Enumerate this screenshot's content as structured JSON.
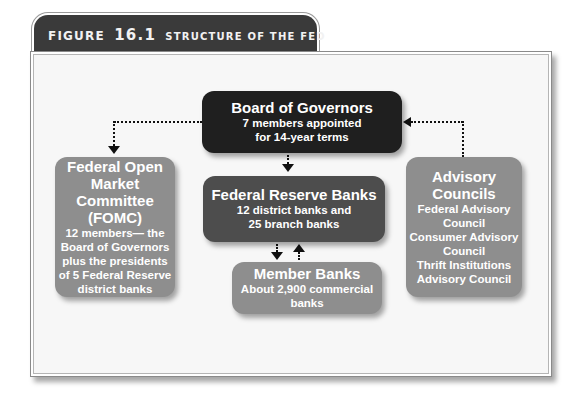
{
  "figure": {
    "label": "FIGURE",
    "number": "16.1",
    "caption": "STRUCTURE OF THE FED"
  },
  "nodes": {
    "board": {
      "title": "Board of Governors",
      "lines": [
        "7 members appointed",
        "for 14-year terms"
      ],
      "color": "#1f1f1f"
    },
    "federal_reserve_banks": {
      "title": "Federal Reserve Banks",
      "lines": [
        "12 district banks and",
        "25 branch banks"
      ],
      "color": "#4d4d4d"
    },
    "member_banks": {
      "title": "Member Banks",
      "lines": [
        "About 2,900 commercial banks"
      ],
      "color": "#8e8e8e"
    },
    "fomc": {
      "title_lines": [
        "Federal Open",
        "Market",
        "Committee (FOMC)"
      ],
      "lines": [
        "12 members— the",
        "Board of Governors",
        "plus the presidents",
        "of 5 Federal Reserve",
        "district banks"
      ],
      "color": "#8e8e8e"
    },
    "advisory": {
      "title_lines": [
        "Advisory",
        "Councils"
      ],
      "lines": [
        "Federal Advisory",
        "Council",
        "Consumer Advisory",
        "Council",
        "Thrift Institutions",
        "Advisory Council"
      ],
      "color": "#8e8e8e"
    }
  },
  "edges": [
    {
      "from": "board",
      "to": "fomc",
      "style": "dotted",
      "arrow": "to"
    },
    {
      "from": "advisory",
      "to": "board",
      "style": "dotted",
      "arrow": "to"
    },
    {
      "from": "board",
      "to": "federal_reserve_banks",
      "style": "dotted",
      "arrow": "to"
    },
    {
      "from": "federal_reserve_banks",
      "to": "member_banks",
      "style": "dotted",
      "arrow": "to"
    },
    {
      "from": "member_banks",
      "to": "federal_reserve_banks",
      "style": "dotted",
      "arrow": "to"
    }
  ]
}
